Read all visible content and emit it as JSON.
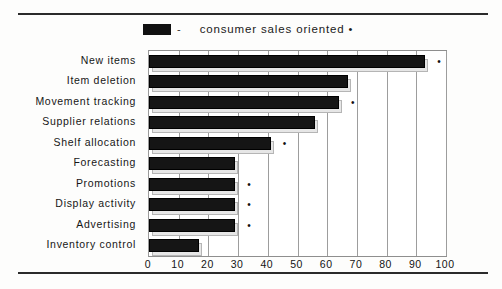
{
  "legend": {
    "swatch_icon": "filled-square-icon",
    "separator": "-",
    "label": "consumer sales oriented",
    "mark": "•"
  },
  "axis": {
    "x_ticks": [
      "0",
      "10",
      "20",
      "30",
      "40",
      "50",
      "60",
      "70",
      "80",
      "90",
      "100"
    ]
  },
  "categories": [
    "New items",
    "Item deletion",
    "Movement tracking",
    "Supplier relations",
    "Shelf allocation",
    "Forecasting",
    "Promotions",
    "Display activity",
    "Advertising",
    "Inventory control"
  ],
  "markers": {
    "star": "•"
  },
  "colors": {
    "bar": "#151515",
    "bar_shadow": "#e6e6e6",
    "grid": "#9d9d9d",
    "frame": "#8e8e8e",
    "rule": "#2b2b2b",
    "text": "#161616"
  },
  "chart_data": {
    "type": "bar",
    "orientation": "horizontal",
    "title": "",
    "subtitle": "",
    "xlabel": "",
    "ylabel": "",
    "xlim": [
      0,
      100
    ],
    "xtick_step": 10,
    "grid": true,
    "legend_position": "top",
    "categories": [
      "New items",
      "Item deletion",
      "Movement tracking",
      "Supplier relations",
      "Shelf allocation",
      "Forecasting",
      "Promotions",
      "Display activity",
      "Advertising",
      "Inventory control"
    ],
    "series": [
      {
        "name": "consumer sales oriented",
        "values": [
          93,
          67,
          64,
          56,
          41,
          29,
          29,
          29,
          29,
          17
        ]
      }
    ],
    "annotations": [
      {
        "category": "New items",
        "marker": "•",
        "value": 93
      },
      {
        "category": "Movement tracking",
        "marker": "•",
        "value": 64
      },
      {
        "category": "Shelf allocation",
        "marker": "•",
        "value": 41
      },
      {
        "category": "Promotions",
        "marker": "•",
        "value": 29
      },
      {
        "category": "Display activity",
        "marker": "•",
        "value": 29
      },
      {
        "category": "Advertising",
        "marker": "•",
        "value": 29
      }
    ]
  }
}
